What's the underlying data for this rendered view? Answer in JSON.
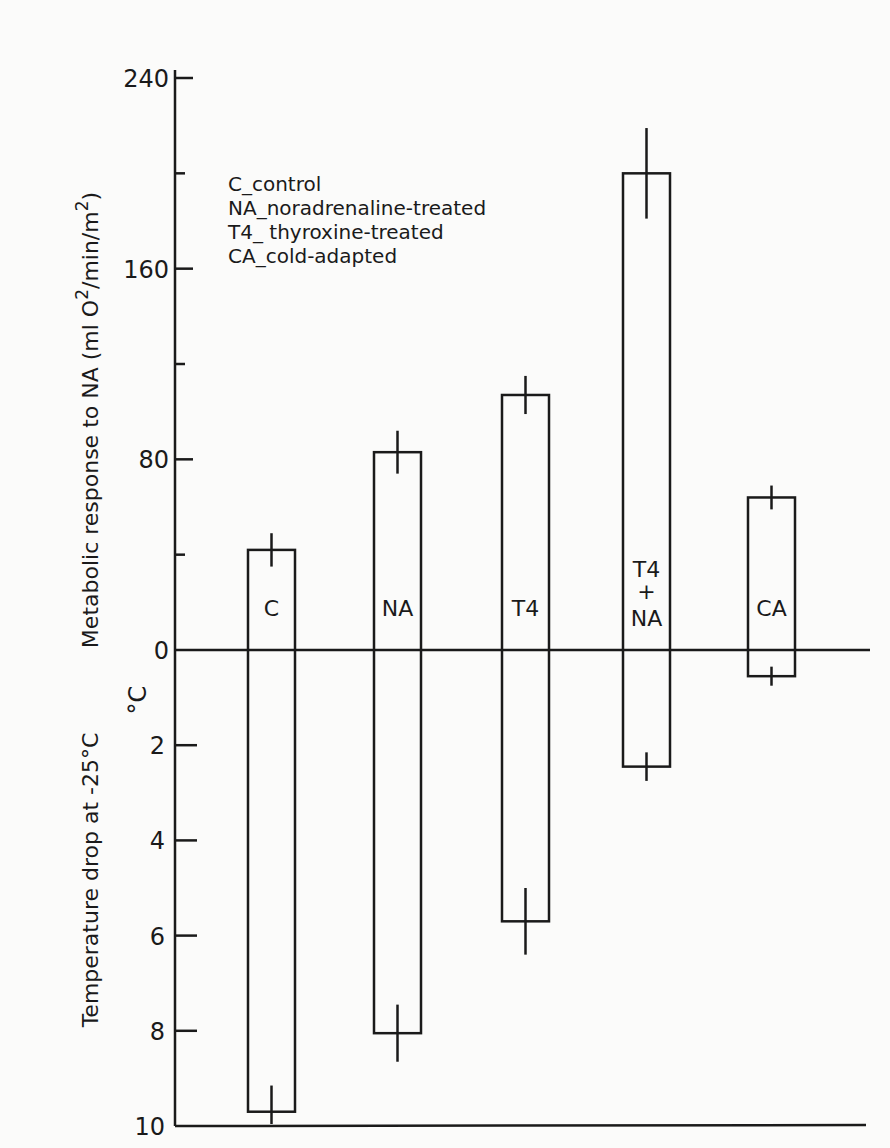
{
  "chart_data": {
    "type": "bar",
    "title": "",
    "categories": [
      "C",
      "NA",
      "T4",
      "T4+NA",
      "CA"
    ],
    "bar_labels": [
      "C",
      "NA",
      "T4",
      "T4 + NA",
      "CA"
    ],
    "series": [
      {
        "name": "Metabolic response to NA (ml O2/min/m2)",
        "direction": "up",
        "values": [
          42,
          83,
          107,
          200,
          64
        ],
        "error": [
          7,
          9,
          8,
          19,
          5
        ]
      },
      {
        "name": "Temperature drop at -25°C (°C)",
        "direction": "down",
        "values": [
          9.7,
          8.05,
          5.7,
          2.45,
          0.55
        ],
        "error": [
          0.55,
          0.6,
          0.7,
          0.3,
          0.2
        ]
      }
    ],
    "upper_axis": {
      "label": "Metabolic response to NA (ml O2/min/m2)",
      "label_parts": {
        "main": "Metabolic response to NA (ml O",
        "sup1": "2",
        "mid": "/min/m",
        "sup2": "2",
        "end": ")"
      },
      "ticks": [
        0,
        80,
        160,
        240
      ],
      "minor_ticks": [
        40,
        120,
        200
      ],
      "ylim": [
        0,
        240
      ]
    },
    "lower_axis": {
      "label": "Temperature drop at -25°C",
      "unit": "°C",
      "ticks": [
        2,
        4,
        6,
        8,
        10
      ],
      "ylim": [
        0,
        10
      ]
    },
    "legend": [
      "C_control",
      "NA_noradrenaline-treated",
      "T4_ thyroxine-treated",
      "CA_cold-adapted"
    ],
    "grid": false,
    "legend_position": "upper-left-inside"
  }
}
